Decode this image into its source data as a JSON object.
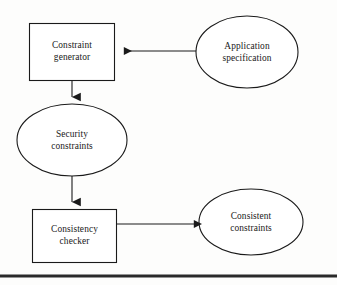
{
  "diagram": {
    "background_color": "#fdfdfc",
    "stroke_color": "#1a1a1a",
    "text_color": "#1a1a1a",
    "nodes": [
      {
        "id": "constraint-generator",
        "shape": "rectangle",
        "label_line1": "Constraint",
        "label_line2": "generator",
        "x": 29,
        "y": 23,
        "width": 86,
        "height": 58
      },
      {
        "id": "application-specification",
        "shape": "ellipse",
        "label_line1": "Application",
        "label_line2": "specification",
        "cx": 247,
        "cy": 52,
        "rx": 51,
        "ry": 36
      },
      {
        "id": "security-constraints",
        "shape": "ellipse",
        "label_line1": "Security",
        "label_line2": "constraints",
        "cx": 72,
        "cy": 140,
        "rx": 55,
        "ry": 36
      },
      {
        "id": "consistency-checker",
        "shape": "rectangle",
        "label_line1": "Consistency",
        "label_line2": "checker",
        "x": 32,
        "y": 209,
        "width": 85,
        "height": 54
      },
      {
        "id": "consistent-constraints",
        "shape": "ellipse",
        "label_line1": "Consistent",
        "label_line2": "constraints",
        "cx": 251,
        "cy": 222,
        "rx": 52,
        "ry": 33
      }
    ],
    "edges": [
      {
        "id": "spec-to-generator",
        "from": "application-specification",
        "to": "constraint-generator",
        "direction": "left",
        "x1": 196,
        "y1": 51,
        "x2": 117,
        "y2": 51
      },
      {
        "id": "generator-to-security",
        "from": "constraint-generator",
        "to": "security-constraints",
        "direction": "down",
        "x1": 72,
        "y1": 81,
        "x2": 72,
        "y2": 106
      },
      {
        "id": "security-to-checker",
        "from": "security-constraints",
        "to": "consistency-checker",
        "direction": "down",
        "x1": 72,
        "y1": 176,
        "x2": 72,
        "y2": 211
      },
      {
        "id": "checker-to-consistent",
        "from": "consistency-checker",
        "to": "consistent-constraints",
        "direction": "right",
        "x1": 117,
        "y1": 224,
        "x2": 201,
        "y2": 224
      }
    ],
    "footer_rule": {
      "id": "bottom-rule",
      "x1": 0,
      "x2": 337,
      "y": 276,
      "thickness": 3
    }
  }
}
